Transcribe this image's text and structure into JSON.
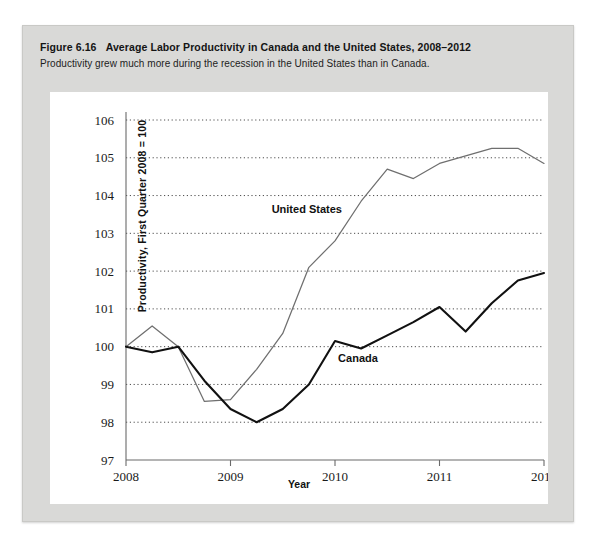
{
  "figure": {
    "number": "Figure 6.16",
    "title": "Average Labor Productivity in Canada and the United States, 2008–2012",
    "subtitle": "Productivity grew much more during the recession in the United States than in Canada."
  },
  "colors": {
    "panel_background": "#d9d9d7",
    "plot_background": "#ffffff",
    "canada_line": "#111111",
    "united_states_line": "#6f6f6f",
    "gridline": "#3a3a3a",
    "axis": "#6a6a6a"
  },
  "chart_data": {
    "type": "line",
    "title": "Average Labor Productivity in Canada and the United States, 2008–2012",
    "subtitle": "Productivity grew much more during the recession in the United States than in Canada.",
    "xlabel": "Year",
    "ylabel": "Productivity, First Quarter 2008 = 100",
    "xlim": [
      2008,
      2012
    ],
    "ylim": [
      97,
      106
    ],
    "grid": true,
    "legend_position": "inline-annotation",
    "y_ticks": [
      97,
      98,
      99,
      100,
      101,
      102,
      103,
      104,
      105,
      106
    ],
    "y_tick_labels": [
      "97",
      "98",
      "99",
      "100",
      "101",
      "102",
      "103",
      "104",
      "105",
      "106"
    ],
    "x_ticks": [
      2008,
      2009,
      2010,
      2011,
      2012
    ],
    "x_tick_labels": [
      "2008",
      "2009",
      "2010",
      "2011",
      "2012"
    ],
    "x": [
      2008.0,
      2008.25,
      2008.5,
      2008.75,
      2009.0,
      2009.25,
      2009.5,
      2009.75,
      2010.0,
      2010.25,
      2010.5,
      2010.75,
      2011.0,
      2011.25,
      2011.5,
      2011.75,
      2012.0
    ],
    "x_quarter_labels": [
      "2008 Q1",
      "2008 Q2",
      "2008 Q3",
      "2008 Q4",
      "2009 Q1",
      "2009 Q2",
      "2009 Q3",
      "2009 Q4",
      "2010 Q1",
      "2010 Q2",
      "2010 Q3",
      "2010 Q4",
      "2011 Q1",
      "2011 Q2",
      "2011 Q3",
      "2011 Q4",
      "2012 Q1"
    ],
    "series": [
      {
        "name": "United States",
        "color": "#6f6f6f",
        "label_x": 2009.73,
        "label_y": 103.55,
        "values": [
          100.0,
          100.55,
          100.0,
          98.55,
          98.6,
          99.4,
          100.35,
          102.1,
          102.8,
          103.85,
          104.7,
          104.45,
          104.85,
          105.05,
          105.25,
          105.25,
          104.85
        ]
      },
      {
        "name": "Canada",
        "color": "#111111",
        "label_x": 2010.22,
        "label_y": 99.6,
        "values": [
          100.0,
          99.85,
          100.0,
          99.1,
          98.35,
          98.0,
          98.35,
          99.0,
          100.15,
          99.95,
          100.3,
          100.65,
          101.05,
          100.4,
          101.15,
          101.75,
          101.95
        ]
      }
    ]
  }
}
